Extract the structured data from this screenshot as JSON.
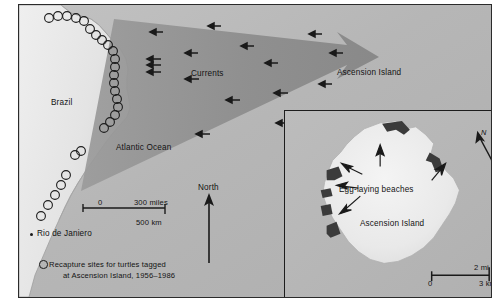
{
  "figure": {
    "background_color": "#ffffff",
    "frame_color": "#2b2b2b",
    "ocean_color": "#b9b9b9",
    "land_color": "#e8e8e8",
    "current_arrow_color": "#8e8e8e",
    "beach_color": "#3a3a3a"
  },
  "main_map": {
    "labels": {
      "brazil": "Brazil",
      "atlantic_ocean": "Atlantic Ocean",
      "currents": "Currents",
      "ascension_island": "Ascension Island",
      "rio": "Rio de Janiero",
      "north": "North"
    },
    "scale_bar": {
      "zero": "0",
      "miles": "300 miles",
      "km": "500 km"
    },
    "legend": {
      "line1": "Recapture sites for turtles tagged",
      "line2": "at Ascension Island, 1956–1986",
      "symbol": "open-circle"
    }
  },
  "inset_map": {
    "labels": {
      "egg_laying_beaches": "Egg-laying beaches",
      "ascension_island": "Ascension Island",
      "north": "N"
    },
    "scale_bar": {
      "miles": "2 mi",
      "zero": "0",
      "km": "3 km"
    }
  },
  "map_data": {
    "type": "thematic-map",
    "recapture_site_count": 27,
    "recapture_sites": [
      [
        47,
        16
      ],
      [
        56,
        14
      ],
      [
        65,
        14
      ],
      [
        74,
        16
      ],
      [
        82,
        19
      ],
      [
        88,
        27
      ],
      [
        94,
        33
      ],
      [
        100,
        38
      ],
      [
        106,
        43
      ],
      [
        111,
        49
      ],
      [
        113,
        57
      ],
      [
        113,
        65
      ],
      [
        112,
        73
      ],
      [
        112,
        81
      ],
      [
        113,
        89
      ],
      [
        115,
        97
      ],
      [
        116,
        105
      ],
      [
        113,
        113
      ],
      [
        108,
        120
      ],
      [
        102,
        126
      ],
      [
        96,
        133
      ],
      [
        90,
        141
      ],
      [
        84,
        150
      ],
      [
        79,
        159
      ],
      [
        74,
        168
      ],
      [
        69,
        177
      ],
      [
        64,
        186
      ]
    ],
    "current_arrows_main": [
      {
        "x": 138,
        "y": 27,
        "len": 11
      },
      {
        "x": 196,
        "y": 21,
        "len": 11
      },
      {
        "x": 172,
        "y": 48,
        "len": 12
      },
      {
        "x": 229,
        "y": 41,
        "len": 11
      },
      {
        "x": 135,
        "y": 54,
        "len": 12
      },
      {
        "x": 142,
        "y": 60,
        "len": 12
      },
      {
        "x": 141,
        "y": 67,
        "len": 12
      },
      {
        "x": 173,
        "y": 74,
        "len": 12
      },
      {
        "x": 253,
        "y": 58,
        "len": 11
      },
      {
        "x": 297,
        "y": 29,
        "len": 11
      },
      {
        "x": 318,
        "y": 48,
        "len": 11
      },
      {
        "x": 214,
        "y": 95,
        "len": 12
      },
      {
        "x": 262,
        "y": 88,
        "len": 12
      },
      {
        "x": 307,
        "y": 79,
        "len": 11
      },
      {
        "x": 184,
        "y": 129,
        "len": 12
      },
      {
        "x": 264,
        "y": 118,
        "len": 11
      }
    ]
  }
}
